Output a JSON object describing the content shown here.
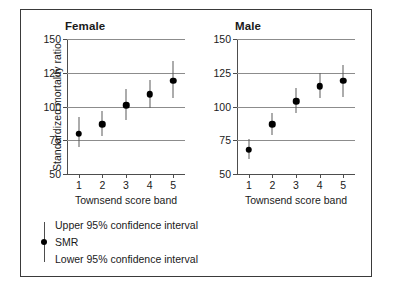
{
  "chart_data": {
    "type": "scatter",
    "title": "",
    "xlabel": "Townsend score band",
    "ylabel": "Standardized mortality ratio",
    "ylim": [
      50,
      150
    ],
    "yticks": [
      50,
      75,
      100,
      125,
      150
    ],
    "ytick_labels": [
      "50",
      "75",
      "100",
      "125",
      "150"
    ],
    "xlim": [
      0.5,
      5.5
    ],
    "categories": [
      "1",
      "2",
      "3",
      "4",
      "5"
    ],
    "grid": "horizontal",
    "legend_position": "below-plot",
    "panels": [
      {
        "name": "female",
        "title": "Female",
        "xlabel": "Townsend score band",
        "points": [
          {
            "x": 1,
            "smr": 80,
            "lower": 70,
            "upper": 92
          },
          {
            "x": 2,
            "smr": 87,
            "lower": 78,
            "upper": 97
          },
          {
            "x": 3,
            "smr": 101,
            "lower": 90,
            "upper": 113
          },
          {
            "x": 4,
            "smr": 109,
            "lower": 99,
            "upper": 120
          },
          {
            "x": 5,
            "smr": 119,
            "lower": 106,
            "upper": 134
          }
        ]
      },
      {
        "name": "male",
        "title": "Male",
        "xlabel": "Townsend score band",
        "points": [
          {
            "x": 1,
            "smr": 68,
            "lower": 61,
            "upper": 76
          },
          {
            "x": 2,
            "smr": 87,
            "lower": 79,
            "upper": 95
          },
          {
            "x": 3,
            "smr": 104,
            "lower": 95,
            "upper": 114
          },
          {
            "x": 4,
            "smr": 115,
            "lower": 106,
            "upper": 125
          },
          {
            "x": 5,
            "smr": 119,
            "lower": 107,
            "upper": 131
          }
        ]
      }
    ],
    "legend": {
      "upper": "Upper 95% confidence interval",
      "smr": "SMR",
      "lower": "Lower 95% confidence interval"
    },
    "colors": {
      "marker": "#000000",
      "errorbar": "#5a5a5a",
      "gridline": "#8c8c8c",
      "axis": "#4d4d4d",
      "frame": "#3a3a3a",
      "text": "#1a1a1a",
      "background": "#ffffff"
    }
  }
}
